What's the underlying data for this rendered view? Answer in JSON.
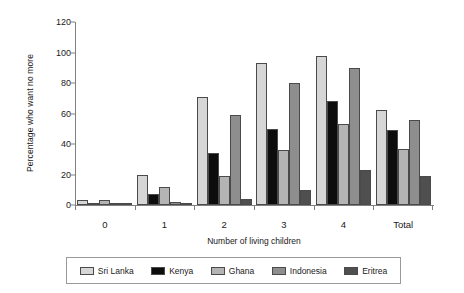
{
  "chart_data": {
    "type": "bar",
    "title": "",
    "xlabel": "Number of living children",
    "ylabel": "Percentage who want no more",
    "categories": [
      "0",
      "1",
      "2",
      "3",
      "4",
      "Total"
    ],
    "ylim": [
      0,
      120
    ],
    "yticks": [
      0,
      20,
      40,
      60,
      80,
      100,
      120
    ],
    "grid": false,
    "legend_position": "bottom",
    "series": [
      {
        "name": "Sri Lanka",
        "color": "#d6d6d6",
        "values": [
          3,
          20,
          71,
          93,
          98,
          62
        ]
      },
      {
        "name": "Kenya",
        "color": "#0d0d0d",
        "values": [
          1,
          7,
          34,
          50,
          68,
          49
        ]
      },
      {
        "name": "Ghana",
        "color": "#b4b4b4",
        "values": [
          3,
          12,
          19,
          36,
          53,
          37
        ]
      },
      {
        "name": "Indonesia",
        "color": "#8e8e8e",
        "values": [
          1,
          2,
          59,
          80,
          90,
          56
        ]
      },
      {
        "name": "Eritrea",
        "color": "#4f4f4f",
        "values": [
          0,
          1,
          4,
          10,
          23,
          19
        ]
      }
    ]
  },
  "legend": {
    "items": [
      {
        "label": "Sri Lanka",
        "color": "#d6d6d6"
      },
      {
        "label": "Kenya",
        "color": "#0d0d0d"
      },
      {
        "label": "Ghana",
        "color": "#b4b4b4"
      },
      {
        "label": "Indonesia",
        "color": "#8e8e8e"
      },
      {
        "label": "Eritrea",
        "color": "#4f4f4f"
      }
    ]
  }
}
